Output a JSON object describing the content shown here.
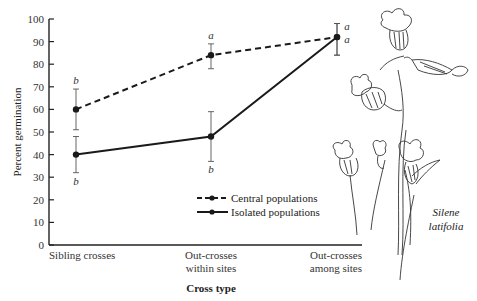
{
  "chart_data": {
    "type": "line",
    "title": "",
    "xlabel": "Cross type",
    "ylabel": "Percent germination",
    "ylim": [
      0,
      100
    ],
    "yticks": [
      0,
      10,
      20,
      30,
      40,
      50,
      60,
      70,
      80,
      90,
      100
    ],
    "grid": false,
    "legend_position": "lower-right (inside plot)",
    "categories": [
      [
        "Sibling crosses"
      ],
      [
        "Out-crosses",
        "within sites"
      ],
      [
        "Out-crosses",
        "among sites"
      ]
    ],
    "category_names": [
      "Sibling crosses",
      "Out-crosses within sites",
      "Out-crosses among sites"
    ],
    "series": [
      {
        "name": "Central populations",
        "line_style": "dashed",
        "values": [
          60,
          84,
          92
        ],
        "error_upper": [
          69,
          89,
          98
        ],
        "error_lower": [
          51,
          78,
          84
        ],
        "significance_letters": [
          "b",
          "a",
          "a"
        ],
        "letter_position": [
          "above",
          "above",
          "right-upper"
        ]
      },
      {
        "name": "Isolated populations",
        "line_style": "solid",
        "values": [
          40,
          48,
          92
        ],
        "error_upper": [
          48,
          59,
          98
        ],
        "error_lower": [
          32,
          37,
          84
        ],
        "significance_letters": [
          "b",
          "b",
          "a"
        ],
        "letter_position": [
          "below",
          "below",
          "right-lower"
        ]
      }
    ],
    "annotations": [
      "Silene latifolia"
    ]
  },
  "illustration": {
    "species_line1": "Silene",
    "species_line2": "latifolia"
  },
  "colors": {
    "line": "#1a1a1a",
    "axis": "#222222",
    "text": "#333333"
  }
}
